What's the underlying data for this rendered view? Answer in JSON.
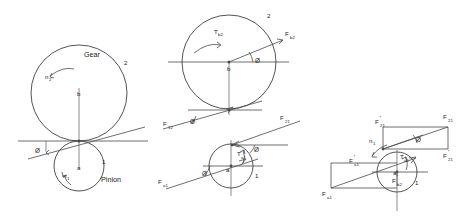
{
  "figure": {
    "stroke_color": "#4a4a4a",
    "text_color": "#222222",
    "background": "#ffffff",
    "panels": [
      {
        "id": "panel-1",
        "name": "gear-pinion-pitch-circles",
        "labels": {
          "gear": "Gear",
          "pinion": "Pinion",
          "gear_center": "b",
          "pinion_center": "a",
          "gear_number": "2",
          "pinion_number": "1",
          "gear_speed": "n",
          "gear_speed_sub": "2",
          "pinion_speed": "n",
          "pinion_speed_sub": "1",
          "pressure_angle": "Ø"
        }
      },
      {
        "id": "panel-2",
        "name": "free-body-gear-and-pinion",
        "labels": {
          "gear_torque": "T",
          "gear_torque_sub": "b2",
          "gear_center": "b",
          "gear_number": "2",
          "pinion_center": "a",
          "pinion_number": "1",
          "pinion_torque": "T",
          "pinion_torque_sub": "a1",
          "force_b2": "F",
          "force_b2_sub": "b2",
          "force_12": "F",
          "force_12_sub": "12",
          "force_21": "F",
          "force_21_sub": "21",
          "force_a1": "F",
          "force_a1_sub": "a1",
          "pressure_angle": "Ø"
        }
      },
      {
        "id": "panel-3",
        "name": "force-resolution-components",
        "labels": {
          "pinion_center": "a",
          "pinion_number": "1",
          "pinion_speed": "n",
          "pinion_speed_sub": "1",
          "pinion_torque": "T",
          "pinion_torque_sub": "a1",
          "force_21": "F",
          "force_21_sub": "21",
          "force_21_prime_top": "F",
          "force_21_prime_top_sub": "21",
          "force_21_prime_right": "F",
          "force_21_prime_right_sub": "21",
          "force_a1": "F",
          "force_a1_sub": "a1",
          "force_a1_prime": "F",
          "force_a1_prime_sub": "a1",
          "force_b2_prime": "F",
          "force_b2_prime_sub": "b2",
          "prime_mark": "'",
          "pressure_angle": "Ø"
        }
      }
    ]
  }
}
